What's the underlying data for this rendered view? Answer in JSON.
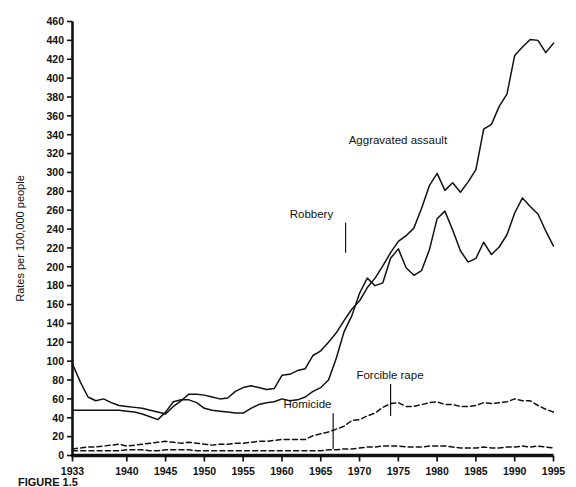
{
  "figure": {
    "caption": "FIGURE 1.5"
  },
  "chart_data": {
    "type": "line",
    "title": "",
    "xlabel": "",
    "ylabel": "Rates per 100,000 people",
    "xlim": [
      1933,
      1995
    ],
    "ylim": [
      0,
      460
    ],
    "grid": false,
    "legend_position": "inline-annotations",
    "yticks": [
      0,
      20,
      40,
      60,
      80,
      100,
      120,
      140,
      160,
      180,
      200,
      220,
      240,
      260,
      280,
      300,
      320,
      340,
      360,
      380,
      400,
      420,
      440,
      460
    ],
    "xticks": [
      1933,
      1940,
      1945,
      1950,
      1955,
      1960,
      1965,
      1970,
      1975,
      1980,
      1985,
      1990,
      1995
    ],
    "x": [
      1933,
      1934,
      1935,
      1936,
      1937,
      1938,
      1939,
      1940,
      1941,
      1942,
      1943,
      1944,
      1945,
      1946,
      1947,
      1948,
      1949,
      1950,
      1951,
      1952,
      1953,
      1954,
      1955,
      1956,
      1957,
      1958,
      1959,
      1960,
      1961,
      1962,
      1963,
      1964,
      1965,
      1966,
      1967,
      1968,
      1969,
      1970,
      1971,
      1972,
      1973,
      1974,
      1975,
      1976,
      1977,
      1978,
      1979,
      1980,
      1981,
      1982,
      1983,
      1984,
      1985,
      1986,
      1987,
      1988,
      1989,
      1990,
      1991,
      1992,
      1993,
      1994,
      1995
    ],
    "series": [
      {
        "name": "Aggravated assault",
        "style": "solid",
        "color": "#111111",
        "label_x": 1972,
        "label_y": 328,
        "values": [
          97,
          78,
          62,
          58,
          60,
          56,
          53,
          52,
          51,
          50,
          48,
          46,
          44,
          52,
          58,
          65,
          65,
          64,
          62,
          60,
          61,
          68,
          72,
          74,
          72,
          70,
          71,
          85,
          86,
          90,
          92,
          106,
          111,
          120,
          130,
          143,
          155,
          164,
          178,
          188,
          201,
          215,
          227,
          233,
          241,
          262,
          286,
          299,
          281,
          289,
          279,
          290,
          303,
          346,
          351,
          370,
          383,
          424,
          433,
          441,
          440,
          427,
          437
        ]
      },
      {
        "name": "Robbery",
        "style": "solid",
        "color": "#111111",
        "label_x": 1963,
        "label_y": 252,
        "values": [
          48,
          48,
          48,
          48,
          48,
          48,
          48,
          47,
          46,
          44,
          41,
          38,
          46,
          57,
          59,
          59,
          56,
          50,
          48,
          47,
          46,
          45,
          45,
          50,
          54,
          56,
          57,
          60,
          58,
          59,
          62,
          68,
          72,
          80,
          103,
          131,
          148,
          172,
          188,
          180,
          183,
          209,
          219,
          199,
          191,
          196,
          218,
          251,
          259,
          239,
          217,
          205,
          209,
          226,
          213,
          221,
          234,
          257,
          273,
          264,
          256,
          238,
          222
        ]
      },
      {
        "name": "Forcible rape",
        "style": "dashed",
        "color": "#111111",
        "label_x": 1973,
        "label_y": 390,
        "values": [
          7,
          8,
          9,
          9,
          10,
          11,
          12,
          10,
          11,
          12,
          13,
          14,
          15,
          14,
          13,
          14,
          13,
          12,
          11,
          12,
          12,
          13,
          13,
          14,
          15,
          15,
          16,
          17,
          17,
          17,
          17,
          21,
          23,
          25,
          28,
          31,
          37,
          38,
          42,
          45,
          51,
          55,
          56,
          52,
          52,
          54,
          56,
          57,
          54,
          54,
          52,
          52,
          53,
          56,
          55,
          56,
          57,
          60,
          58,
          58,
          53,
          49,
          46
        ]
      },
      {
        "name": "Homicide",
        "style": "dashed",
        "color": "#111111",
        "label_x": 1963,
        "label_y": 406,
        "values": [
          5,
          5,
          5,
          5,
          5,
          5,
          5,
          6,
          6,
          6,
          5,
          5,
          6,
          6,
          6,
          6,
          5,
          5,
          5,
          5,
          5,
          5,
          5,
          5,
          5,
          5,
          5,
          5,
          5,
          5,
          5,
          5,
          5,
          6,
          6,
          7,
          7,
          8,
          9,
          9,
          10,
          10,
          10,
          9,
          9,
          9,
          10,
          10,
          10,
          9,
          8,
          8,
          8,
          9,
          8,
          8,
          9,
          9,
          10,
          9,
          10,
          9,
          8
        ]
      }
    ],
    "annotations": [
      {
        "text": "Aggravated assault",
        "x": 1968.6,
        "y": 330,
        "leader": false
      },
      {
        "text": "Robbery",
        "x": 1961.0,
        "y": 252,
        "leader": true,
        "leader_to_y": 215,
        "leader_x": 1968.2
      },
      {
        "text": "Forcible rape",
        "x": 1969.6,
        "y": 81,
        "leader": true,
        "leader_to_y": 42,
        "leader_x": 1974.0
      },
      {
        "text": "Homicide",
        "x": 1960.2,
        "y": 50,
        "leader": true,
        "leader_to_y": 7,
        "leader_x": 1966.6
      }
    ]
  }
}
